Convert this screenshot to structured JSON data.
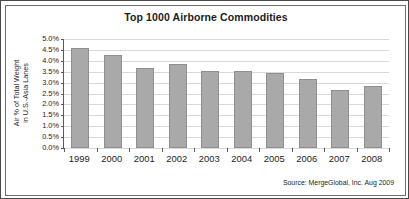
{
  "figure": {
    "border_color": "#4a4a4a",
    "inner_border_color": "#6e6e6e",
    "background": "#ffffff"
  },
  "title": "Top 1000 Airborne Commodities",
  "ylabel_line1": "Air % of Total Weight",
  "ylabel_line2": "in U.S.-Asia Lanes",
  "source": "Source: MergeGlobal, Inc. Aug 2009",
  "colors": {
    "bar_fill": "#a9a9a9",
    "bar_edge": "#8f8f8f",
    "gridline": "#d9d9d9",
    "axis": "#5a5a5a",
    "text": "#1c1c1c"
  },
  "chart_data": {
    "type": "bar",
    "title": "Top 1000 Airborne Commodities",
    "xlabel": "",
    "ylabel": "Air % of Total Weight in U.S.-Asia Lanes",
    "categories": [
      "1999",
      "2000",
      "2001",
      "2002",
      "2003",
      "2004",
      "2005",
      "2006",
      "2007",
      "2008"
    ],
    "values": [
      4.6,
      4.25,
      3.65,
      3.85,
      3.55,
      3.55,
      3.45,
      3.15,
      2.65,
      2.85
    ],
    "value_labels": [
      "4.6%",
      "4.25%",
      "3.65%",
      "3.85%",
      "3.55%",
      "3.55%",
      "3.45%",
      "3.15%",
      "2.65%",
      "2.85%"
    ],
    "ylim": [
      0.0,
      5.0
    ],
    "ytick_values": [
      5.0,
      4.5,
      4.0,
      3.5,
      3.0,
      2.5,
      2.0,
      1.5,
      1.0,
      0.5,
      0.0
    ],
    "ytick_labels": [
      "5.0%",
      "4.5%",
      "4.0%",
      "3.5%",
      "3.0%",
      "2.5%",
      "2.0%",
      "1.5%",
      "1.0%",
      "0.5%",
      "0.0%"
    ],
    "grid": "horizontal",
    "legend": "none",
    "annotations": [
      "Source: MergeGlobal, Inc. Aug 2009"
    ]
  }
}
